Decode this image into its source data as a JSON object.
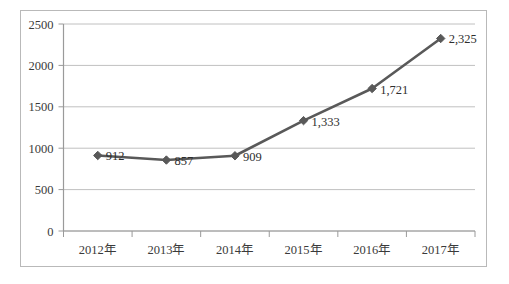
{
  "chart_data": {
    "type": "line",
    "title": "",
    "subtitle": "",
    "xlabel": "",
    "ylabel": "",
    "categories": [
      "2012年",
      "2013年",
      "2014年",
      "2015年",
      "2016年",
      "2017年"
    ],
    "values": [
      912,
      857,
      909,
      1333,
      1721,
      2325
    ],
    "point_labels": [
      "912",
      "857",
      "909",
      "1,333",
      "1,721",
      "2,325"
    ],
    "series": [
      {
        "name": "",
        "values": [
          912,
          857,
          909,
          1333,
          1721,
          2325
        ]
      }
    ],
    "ylim": [
      0,
      2500
    ],
    "yticks": [
      0,
      500,
      1000,
      1500,
      2000,
      2500
    ],
    "ytick_labels": [
      "0",
      "500",
      "1000",
      "1500",
      "2000",
      "2500"
    ],
    "grid": "horizontal",
    "legend": "none",
    "marker": "diamond",
    "colors": {
      "line": "#595959",
      "marker": "#595959",
      "gridline": "#c0c0c0",
      "axis": "#9a9a9a",
      "border": "#b9b9b9",
      "text": "#3a3a3a",
      "background": "#ffffff"
    }
  }
}
